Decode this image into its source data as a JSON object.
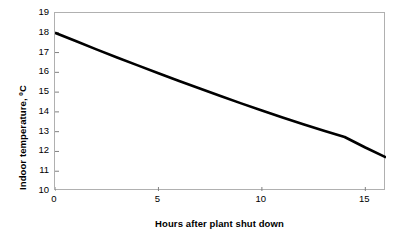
{
  "chart_data": {
    "type": "line",
    "title": "",
    "xlabel": "Hours after plant shut down",
    "ylabel": "Indoor temperature,  ºC",
    "xlim": [
      0,
      16
    ],
    "ylim": [
      10,
      19
    ],
    "xticks": [
      0,
      5,
      10,
      15
    ],
    "xtick_labels": [
      "0",
      "5",
      "10",
      "15"
    ],
    "yticks": [
      10,
      11,
      12,
      13,
      14,
      15,
      16,
      17,
      18,
      19
    ],
    "ytick_labels": [
      "10",
      "11",
      "12",
      "13",
      "14",
      "15",
      "16",
      "17",
      "18",
      "19"
    ],
    "grid": false,
    "legend": null,
    "series": [
      {
        "name": "Indoor temperature",
        "color": "#000000",
        "line_width": 2.6,
        "x": [
          0,
          1,
          2,
          3,
          4,
          5,
          6,
          7,
          8,
          9,
          10,
          11,
          12,
          13,
          14,
          15,
          16
        ],
        "y": [
          18.0,
          17.58,
          17.16,
          16.75,
          16.35,
          15.95,
          15.56,
          15.18,
          14.8,
          14.43,
          14.07,
          13.72,
          13.38,
          13.05,
          12.73,
          12.2,
          11.7
        ]
      }
    ]
  },
  "axes": {
    "frame_color": "#b0b0b0",
    "tick_color": "#808080",
    "background": "#ffffff"
  }
}
